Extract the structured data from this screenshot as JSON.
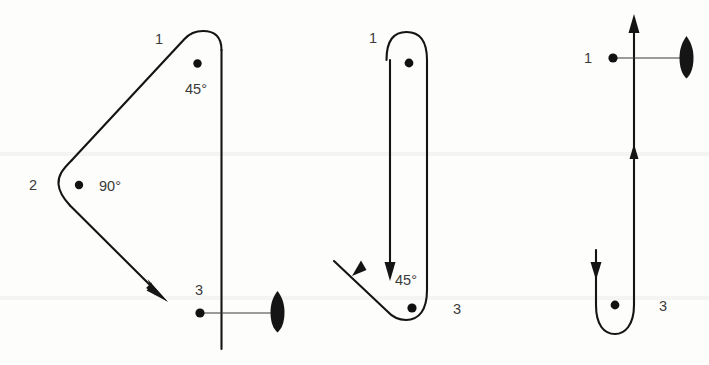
{
  "figure": {
    "background_color": "#fdfdfc",
    "ink_color": "#141414",
    "label_color": "#3a3a3a"
  },
  "diagrams": [
    {
      "id": "left",
      "name": "wide-turn-track",
      "waypoint_labels": [
        "1",
        "2",
        "3"
      ],
      "angle_labels": [
        "45°",
        "90°"
      ],
      "ship_symbol": "ship-icon",
      "arrow_count": 1
    },
    {
      "id": "middle",
      "name": "narrow-turn-track",
      "waypoint_labels": [
        "1",
        "3"
      ],
      "angle_labels": [
        "45°"
      ],
      "ship_symbol": null,
      "arrow_count": 2
    },
    {
      "id": "right",
      "name": "u-turn-track",
      "waypoint_labels": [
        "1",
        "3"
      ],
      "angle_labels": [],
      "ship_symbol": "ship-icon",
      "arrow_count": 3
    }
  ],
  "labels": {
    "d1_point1": "1",
    "d1_point2": "2",
    "d1_point3": "3",
    "d1_angle1": "45°",
    "d1_angle2": "90°",
    "d2_point1": "1",
    "d2_point3": "3",
    "d2_angle1": "45°",
    "d3_point1": "1",
    "d3_point3": "3"
  }
}
